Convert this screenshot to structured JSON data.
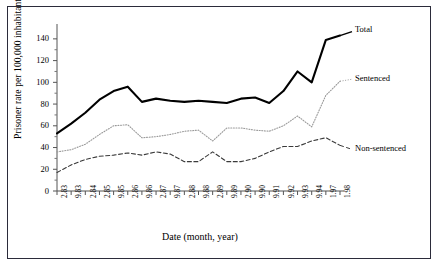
{
  "figure": {
    "title": "",
    "y_axis_title": "Prisoner rate per 100,000 inhabitants",
    "x_axis_title": "Date (month, year)"
  },
  "legend": {
    "total": "Total",
    "sentenced": "Sentenced",
    "non_sentenced": "Non-sentenced"
  },
  "chart_data": {
    "type": "line",
    "title": "",
    "xlabel": "Date (month, year)",
    "ylabel": "Prisoner rate per 100,000 inhabitants",
    "ylim": [
      0,
      150
    ],
    "yticks": [
      0,
      20,
      40,
      60,
      80,
      100,
      120,
      140
    ],
    "ytick_labels": [
      "0",
      "20",
      "40",
      "60",
      "80",
      "100",
      "120",
      "140"
    ],
    "grid": false,
    "legend_position": "right-inline-labels",
    "categories": [
      "2.83",
      "9.83",
      "2.84",
      "2.85",
      "9.85",
      "2.86",
      "9.86",
      "2.87",
      "9.87",
      "2.88",
      "9.88",
      "2.89",
      "9.89",
      "2.90",
      "9.90",
      "9.91",
      "9.92",
      "9.93",
      "9.94",
      "1.97",
      "1.98"
    ],
    "series": [
      {
        "name": "Total",
        "style": "solid-thick",
        "color": "#000000",
        "values": [
          53,
          62,
          72,
          84,
          92,
          96,
          82,
          85,
          83,
          82,
          83,
          82,
          81,
          85,
          86,
          81,
          92,
          110,
          100,
          139,
          143
        ]
      },
      {
        "name": "Sentenced",
        "style": "dotted",
        "color": "#9a9a9a",
        "values": [
          36,
          38,
          43,
          52,
          60,
          61,
          49,
          50,
          52,
          55,
          56,
          46,
          58,
          58,
          56,
          55,
          60,
          69,
          59,
          88,
          101
        ]
      },
      {
        "name": "Non-sentenced",
        "style": "dashed",
        "color": "#3a3a3a",
        "values": [
          17,
          24,
          29,
          32,
          33,
          35,
          33,
          36,
          34,
          27,
          27,
          36,
          27,
          27,
          30,
          36,
          41,
          41,
          46,
          49,
          42
        ]
      }
    ]
  }
}
